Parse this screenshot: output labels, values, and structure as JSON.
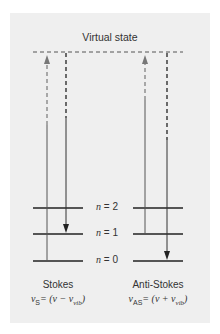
{
  "title": "Virtual state",
  "levels": [
    {
      "label": "n",
      "value": "2",
      "text": "n = 2"
    },
    {
      "label": "n",
      "value": "1",
      "text": "n = 1"
    },
    {
      "label": "n",
      "value": "0",
      "text": "n = 0"
    }
  ],
  "stokes": {
    "name": "Stokes",
    "formula_symbol": "ν",
    "formula_sub": "S",
    "formula_rhs": "= (ν − ν",
    "formula_rhs_sub": "vib",
    "formula_close": ")",
    "formula_text": "νS = (ν − νvib)"
  },
  "anti_stokes": {
    "name": "Anti-Stokes",
    "formula_symbol": "ν",
    "formula_sub": "AS",
    "formula_rhs": "= (ν + ν",
    "formula_rhs_sub": "vib",
    "formula_close": ")",
    "formula_text": "νAS = (ν + νvib)"
  },
  "colors": {
    "panel": "#efefef",
    "line": "#333333",
    "excitation_arrow": "#888888",
    "emission_arrow": "#222222"
  }
}
